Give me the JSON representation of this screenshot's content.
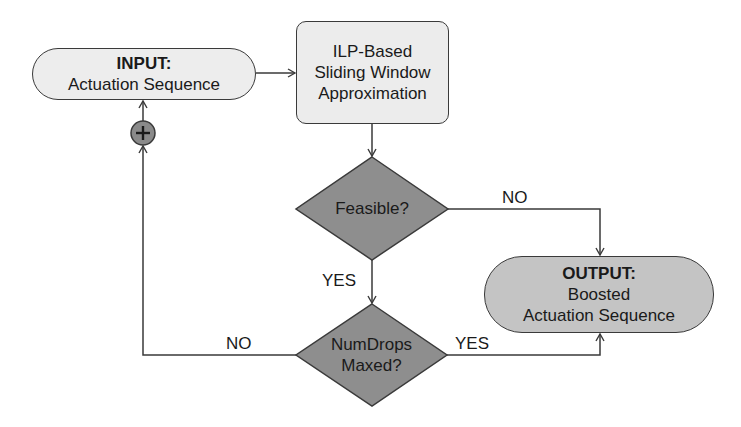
{
  "colors": {
    "input_fill": "#ededed",
    "process_fill": "#ececec",
    "diamond_fill": "#8e8e8e",
    "output_fill": "#c4c4c4",
    "stroke": "#3a3a3a",
    "plus_fill": "#8a8a8a"
  },
  "nodes": {
    "input": {
      "title": "INPUT:",
      "text": "Actuation Sequence"
    },
    "process": {
      "line1": "ILP-Based",
      "line2": "Sliding Window",
      "line3": "Approximation"
    },
    "feasible": {
      "text": "Feasible?"
    },
    "numdrops": {
      "line1": "NumDrops",
      "line2": "Maxed?"
    },
    "output": {
      "title": "OUTPUT:",
      "line1": "Boosted",
      "line2": "Actuation Sequence"
    },
    "increment": {
      "icon": "plus-icon",
      "glyph": "+"
    }
  },
  "edges": {
    "feasible_no": "NO",
    "feasible_yes": "YES",
    "numdrops_no": "NO",
    "numdrops_yes": "YES"
  }
}
